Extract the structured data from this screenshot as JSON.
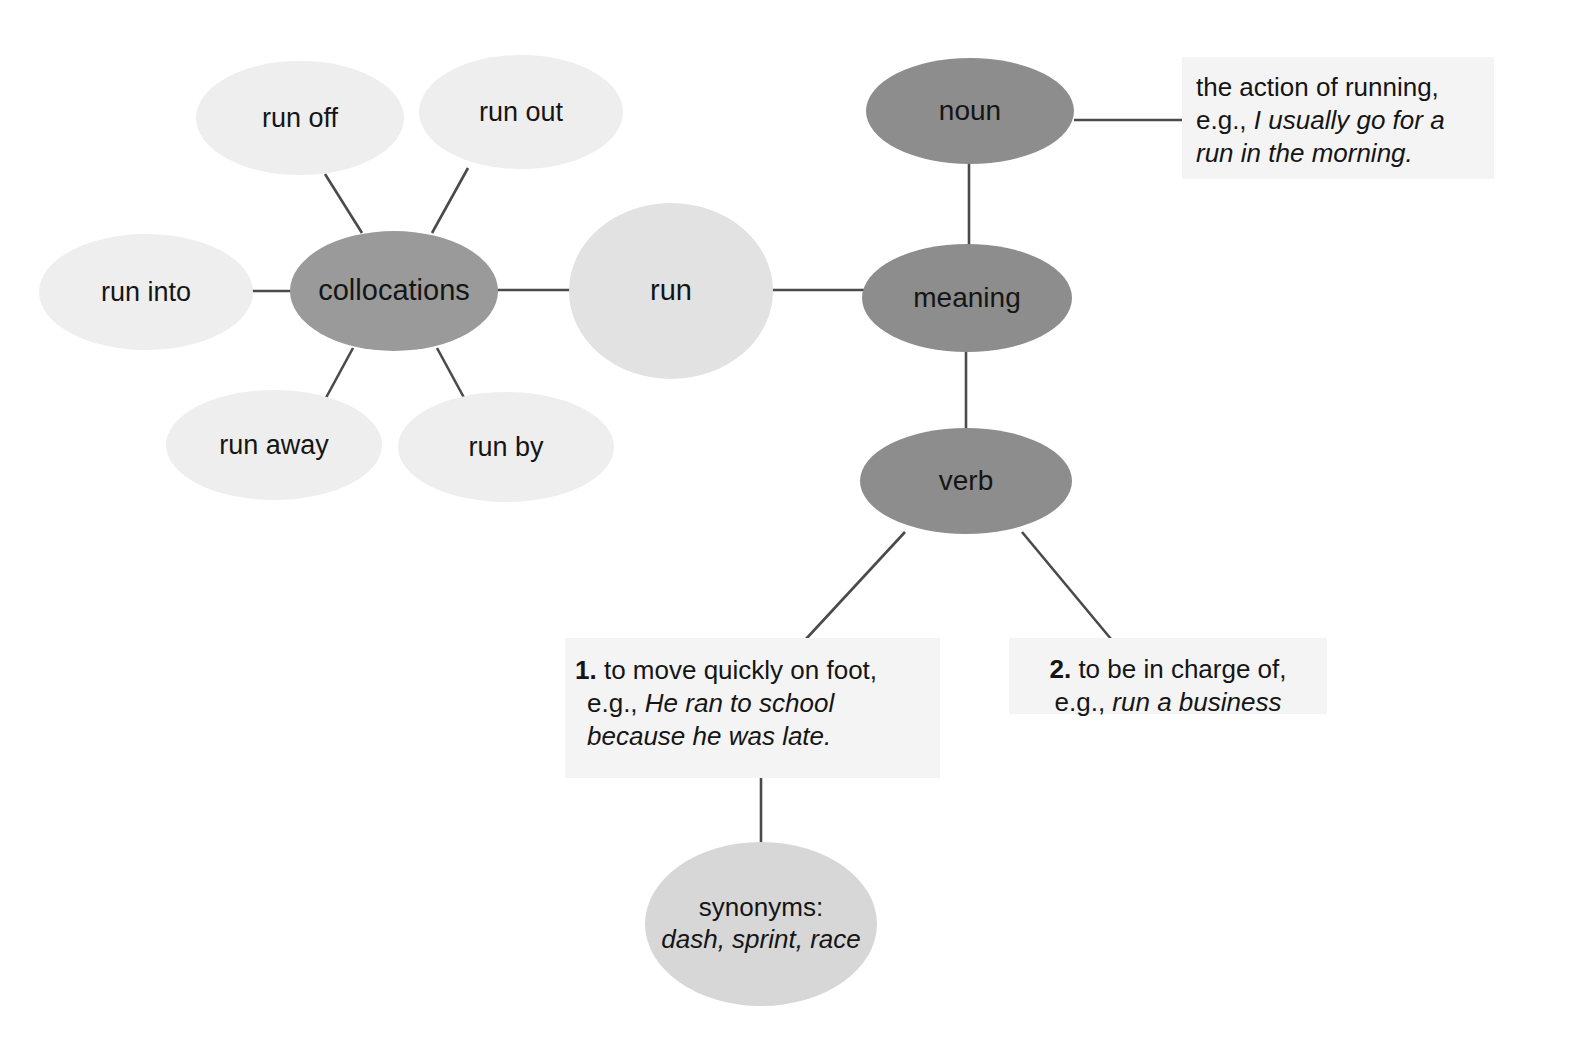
{
  "diagram": {
    "center": {
      "label": "run"
    },
    "branches": {
      "collocations": {
        "label": "collocations"
      },
      "meaning": {
        "label": "meaning"
      },
      "noun": {
        "label": "noun"
      },
      "verb": {
        "label": "verb"
      }
    },
    "collocations": [
      {
        "label": "run off"
      },
      {
        "label": "run out"
      },
      {
        "label": "run into"
      },
      {
        "label": "run away"
      },
      {
        "label": "run by"
      }
    ],
    "noun_definition": {
      "plain": "the action of running, e.g.,",
      "example": "I usually go for a run in the morning."
    },
    "verb_definitions": [
      {
        "number": "1.",
        "plain": "to move quickly on foot, e.g.,",
        "example": "He ran to school because he was late."
      },
      {
        "number": "2.",
        "plain": "to be in charge of, e.g.,",
        "example": "run a business"
      }
    ],
    "synonyms": {
      "label": "synonyms:",
      "words": "dash, sprint, race"
    },
    "colors": {
      "background": "#ffffff",
      "node_faint": "#eeeeee",
      "node_light": "#e2e2e2",
      "node_soft": "#d7d7d7",
      "node_mid": "#9a9a9a",
      "node_dark": "#8d8d8d",
      "textbox_bg": "#f4f4f4",
      "edge": "#4a4a4a",
      "text": "#151515"
    }
  }
}
